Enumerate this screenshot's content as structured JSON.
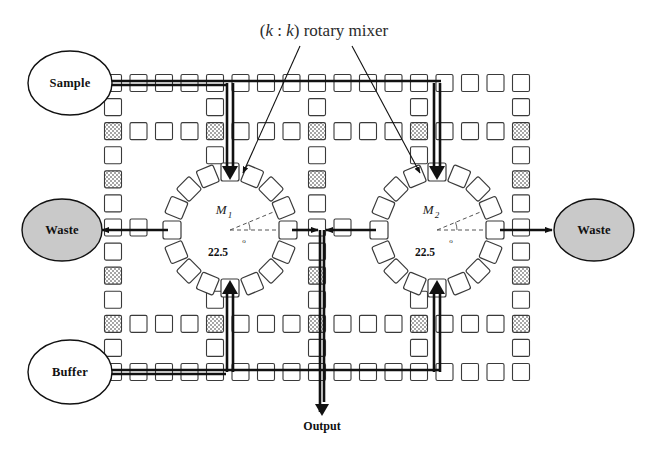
{
  "figure": {
    "title": "(k : k) rotary mixer",
    "title_parts": {
      "open": "(",
      "k1": "k",
      "colon": " : ",
      "k2": "k",
      "close": ")",
      "rest": " rotary mixer"
    },
    "type": "digital-microfluidic-biochip-schematic"
  },
  "ports": {
    "sample": {
      "label": "Sample",
      "fill": "#ffffff",
      "stroke": "#111111",
      "cx": 70,
      "cy": 83,
      "rx": 42,
      "ry": 32
    },
    "buffer": {
      "label": "Buffer",
      "fill": "#ffffff",
      "stroke": "#111111",
      "cx": 70,
      "cy": 372,
      "rx": 42,
      "ry": 32
    },
    "waste_left": {
      "label": "Waste",
      "fill": "#c9c9c9",
      "stroke": "#111111",
      "cx": 62,
      "cy": 230,
      "rx": 40,
      "ry": 31
    },
    "waste_right": {
      "label": "Waste",
      "fill": "#c9c9c9",
      "stroke": "#111111",
      "cx": 594,
      "cy": 230,
      "rx": 40,
      "ry": 31
    },
    "output": {
      "label": "Output",
      "x": 322,
      "y": 430
    }
  },
  "mixers": [
    {
      "name": "M",
      "sub": "1",
      "angle": "22.5",
      "degree_symbol": "o",
      "cx": 230,
      "cy": 230,
      "ring_cells": 16,
      "ring_radius": 58,
      "cell_size": 18
    },
    {
      "name": "M",
      "sub": "2",
      "angle": "22.5",
      "degree_symbol": "o",
      "cx": 437,
      "cy": 230,
      "ring_cells": 16,
      "ring_radius": 58,
      "cell_size": 18
    }
  ],
  "grid": {
    "cell_size": 17,
    "pitch": 25.5,
    "cols": 17,
    "rows": 13,
    "x0": 113,
    "y0": 83,
    "cell_fill": "#ffffff",
    "cell_stroke": "#3a3a3a",
    "hatched_fill": "#a6a6a6",
    "bus_rows": [
      0,
      12
    ],
    "sparse_rows": [
      2,
      10
    ],
    "sparse_cols": [
      0,
      4,
      8,
      12,
      16
    ],
    "mid_row": 6
  },
  "flows": {
    "color": "#111111",
    "sample_bus_y": 83,
    "buffer_bus_y": 372,
    "waste_row_y": 230,
    "output_x": 322,
    "output_end_y": 412,
    "down_columns": [
      230,
      437
    ],
    "up_columns": [
      230,
      437
    ]
  },
  "annotations": {
    "title_anchor_x": 324,
    "title_anchor_y": 36,
    "leader_targets": [
      {
        "from_x": 300,
        "from_y": 46,
        "to_x": 243,
        "to_y": 173
      },
      {
        "from_x": 352,
        "from_y": 46,
        "to_x": 420,
        "to_y": 173
      }
    ]
  },
  "colors": {
    "ink": "#111111",
    "grid_stroke": "#3a3a3a",
    "hatch": "#a6a6a6",
    "waste_fill": "#c9c9c9",
    "background": "#ffffff"
  }
}
